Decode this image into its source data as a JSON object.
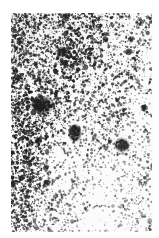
{
  "figure": {
    "kind": "grayscale-micrograph",
    "width": 159,
    "height": 238,
    "background_color": "#ffffff",
    "plate": {
      "x": 11,
      "y": 13,
      "width": 141,
      "height": 219,
      "base_tone": "#fbfbfb",
      "grain_color": "#1a1a1a"
    },
    "grain": {
      "count": 9000,
      "min_radius": 0.35,
      "max_radius": 1.35,
      "seed": 20240517
    },
    "density_gradient": {
      "note": "darker toward left edge and upper-left, lighter toward lower-right",
      "dark_corner": "left",
      "light_corner": "bottom-right",
      "left_edge_density": 1.0,
      "right_edge_density": 0.42,
      "top_density": 0.92,
      "bottom_right_density": 0.3
    },
    "blobs": [
      {
        "name": "blob-upper-left-small",
        "cx": 51,
        "cy": 39,
        "rx": 4.5,
        "ry": 3.6,
        "opacity": 0.88
      },
      {
        "name": "blob-mid-left-large",
        "cx": 31,
        "cy": 92,
        "rx": 8.5,
        "ry": 5.5,
        "opacity": 0.92
      },
      {
        "name": "blob-center-elongated",
        "cx": 64,
        "cy": 120,
        "rx": 4.0,
        "ry": 6.5,
        "opacity": 0.9
      },
      {
        "name": "blob-right-round",
        "cx": 111,
        "cy": 132,
        "rx": 5.5,
        "ry": 4.8,
        "opacity": 0.9
      },
      {
        "name": "blob-right-upper-dot",
        "cx": 133,
        "cy": 95,
        "rx": 2.6,
        "ry": 2.4,
        "opacity": 0.8
      },
      {
        "name": "blob-left-lower-dot",
        "cx": 27,
        "cy": 128,
        "rx": 3.0,
        "ry": 2.4,
        "opacity": 0.75
      },
      {
        "name": "blob-top-right-dot",
        "cx": 120,
        "cy": 26,
        "rx": 2.4,
        "ry": 2.0,
        "opacity": 0.7
      },
      {
        "name": "blob-bottom-left-dot",
        "cx": 36,
        "cy": 170,
        "rx": 2.8,
        "ry": 2.2,
        "opacity": 0.7
      }
    ],
    "caption": ""
  }
}
